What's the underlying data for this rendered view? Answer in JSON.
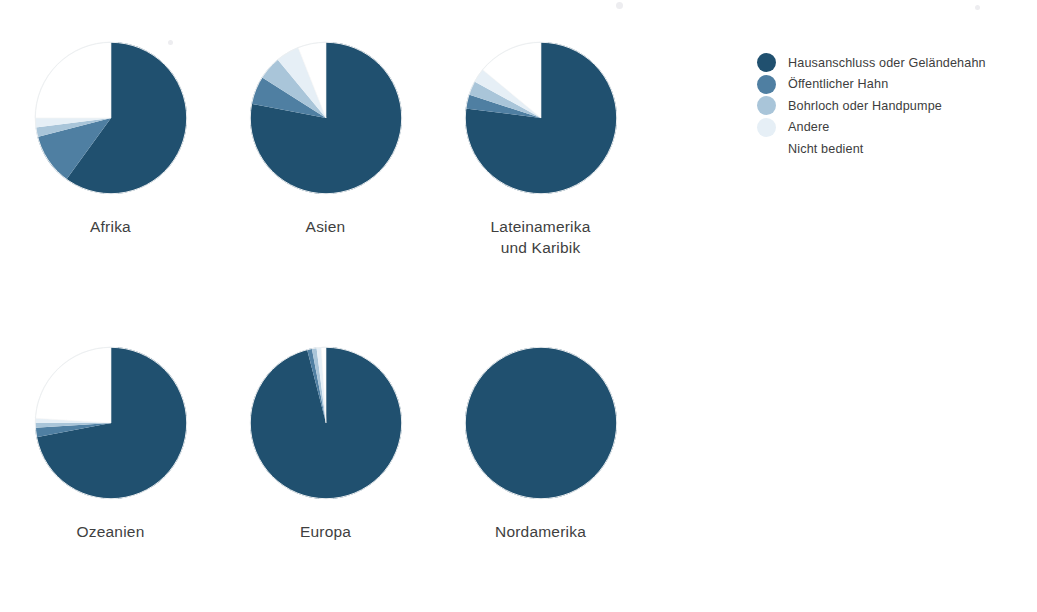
{
  "chart_data": {
    "type": "pie",
    "title": "",
    "subtitle": "",
    "xlabel": "",
    "ylabel": "",
    "grid": false,
    "legend_position": "right",
    "units": "percent",
    "start_angle_deg": 0,
    "direction": "clockwise",
    "legend": [
      {
        "label": "Hausanschluss oder Geländehahn",
        "color": "#20506f"
      },
      {
        "label": "Öffentlicher Hahn",
        "color": "#4f7fa2"
      },
      {
        "label": "Bohrloch oder Handpumpe",
        "color": "#a9c5d9"
      },
      {
        "label": "Andere",
        "color": "#e6eff6"
      },
      {
        "label": "Nicht bedient",
        "color": "#ffffff"
      }
    ],
    "categories": [
      "Hausanschluss oder Geländehahn",
      "Öffentlicher Hahn",
      "Bohrloch oder Handpumpe",
      "Andere",
      "Nicht bedient"
    ],
    "charts": [
      {
        "name": "Afrika",
        "label": "Afrika",
        "radius_px": 76,
        "values": [
          60,
          11,
          2,
          2,
          25
        ]
      },
      {
        "name": "Asien",
        "label": "Asien",
        "radius_px": 76,
        "values": [
          78,
          6,
          5,
          5,
          6
        ]
      },
      {
        "name": "Lateinamerika und Karibik",
        "label": "Lateinamerika\nund Karibik",
        "radius_px": 76,
        "values": [
          77,
          3,
          3,
          3,
          14
        ]
      },
      {
        "name": "Ozeanien",
        "label": "Ozeanien",
        "radius_px": 76,
        "values": [
          72,
          2,
          1,
          1,
          24
        ]
      },
      {
        "name": "Europa",
        "label": "Europa",
        "radius_px": 76,
        "values": [
          96,
          1,
          1,
          1,
          1
        ]
      },
      {
        "name": "Nordamerika",
        "label": "Nordamerika",
        "radius_px": 76,
        "values": [
          100,
          0,
          0,
          0,
          0
        ]
      }
    ]
  },
  "legend": {
    "items": [
      {
        "label": "Hausanschluss oder Geländehahn",
        "color": "#20506f"
      },
      {
        "label": "Öffentlicher Hahn",
        "color": "#4f7fa2"
      },
      {
        "label": "Bohrloch oder Handpumpe",
        "color": "#a9c5d9"
      },
      {
        "label": "Andere",
        "color": "#e6eff6"
      },
      {
        "label": "Nicht bedient",
        "color": "#ffffff"
      }
    ]
  }
}
